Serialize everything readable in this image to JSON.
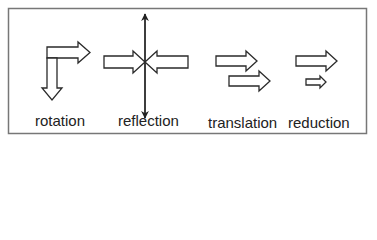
{
  "diagram": {
    "stroke_color": "#2a2a2a",
    "frame_color": "#777777",
    "panels": [
      {
        "id": "rotation",
        "label": "rotation"
      },
      {
        "id": "reflection",
        "label": "reflection"
      },
      {
        "id": "translation",
        "label": "translation"
      },
      {
        "id": "reduction",
        "label": "reduction"
      }
    ]
  }
}
